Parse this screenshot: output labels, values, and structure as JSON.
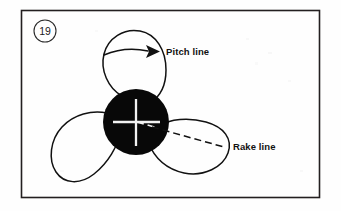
{
  "figure": {
    "number": "19",
    "background_color": "#fefefe",
    "frame_color": "#231f20",
    "ink_color": "#111111",
    "hub_color": "#080808",
    "crosshair_color": "#f2f2f2",
    "frame": {
      "x": 21,
      "y": 10,
      "width": 299,
      "height": 188
    },
    "number_badge": {
      "cx": 45,
      "cy": 31,
      "r": 11
    }
  },
  "labels": {
    "pitch_line": "Pitch line",
    "rake_line": "Rake line"
  },
  "diagram": {
    "hub": {
      "cx": 136,
      "cy": 122,
      "r": 33
    },
    "crosshair": {
      "horizontal": {
        "x1": 114,
        "y1": 122,
        "x2": 159,
        "y2": 122
      },
      "vertical": {
        "x1": 136,
        "y1": 100,
        "x2": 136,
        "y2": 145
      }
    },
    "blades": [
      {
        "name": "upper-blade",
        "angle_deg": -95
      },
      {
        "name": "lower-left-blade",
        "angle_deg": 145
      },
      {
        "name": "lower-right-blade",
        "angle_deg": 30
      }
    ],
    "pitch_arrow": {
      "start": {
        "x": 104,
        "y": 54
      },
      "end": {
        "x": 157,
        "y": 51
      },
      "style": "curved-solid-with-arrowhead"
    },
    "rake_dashed_line": {
      "start": {
        "x": 136,
        "y": 122
      },
      "end": {
        "x": 224,
        "y": 147
      },
      "style": "dashed",
      "dash_pattern": "7 4"
    }
  }
}
